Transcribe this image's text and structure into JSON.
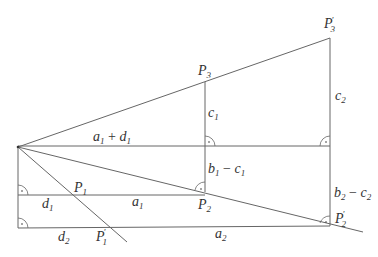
{
  "diagram": {
    "type": "geometric-construction",
    "labels": {
      "P3_prime": {
        "base": "P",
        "sub": "3",
        "prime": "′"
      },
      "P3": {
        "base": "P",
        "sub": "3"
      },
      "c1": {
        "base": "c",
        "sub": "1"
      },
      "c2": {
        "base": "c",
        "sub": "2"
      },
      "a1_plus_d1": {
        "a": "a",
        "a_sub": "1",
        "op": " + ",
        "d": "d",
        "d_sub": "1"
      },
      "b1_minus_c1": {
        "b": "b",
        "b_sub": "1",
        "op": " − ",
        "c": "c",
        "c_sub": "1"
      },
      "b2_minus_c2": {
        "b": "b",
        "b_sub": "2",
        "op": " − ",
        "c": "c",
        "c_sub": "2"
      },
      "P1": {
        "base": "P",
        "sub": "1"
      },
      "P1_prime": {
        "base": "P",
        "sub": "1",
        "prime": "′"
      },
      "P2": {
        "base": "P",
        "sub": "2"
      },
      "P2_prime": {
        "base": "P",
        "sub": "2",
        "prime": "′"
      },
      "d1": {
        "base": "d",
        "sub": "1"
      },
      "d2": {
        "base": "d",
        "sub": "2"
      },
      "a1": {
        "base": "a",
        "sub": "1"
      },
      "a2": {
        "base": "a",
        "sub": "2"
      }
    },
    "points": {
      "O": [
        18,
        147
      ],
      "P3": [
        205,
        82
      ],
      "P3_prime": [
        330,
        38
      ],
      "P1": [
        73,
        194
      ],
      "P1_prime": [
        110,
        227
      ],
      "P2": [
        204,
        190
      ],
      "P2_prime": [
        330,
        224
      ]
    },
    "right_angle_marks": 6
  }
}
